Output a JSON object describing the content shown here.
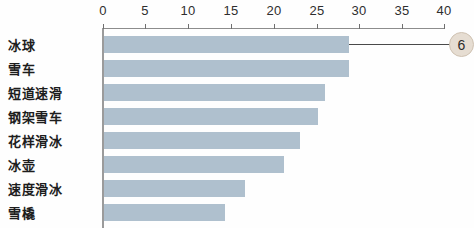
{
  "chart_data": {
    "type": "bar",
    "orientation": "horizontal",
    "title": "",
    "xlabel": "",
    "ylabel": "",
    "categories": [
      "冰球",
      "雪车",
      "短道速滑",
      "钢架雪车",
      "花样滑冰",
      "冰壶",
      "速度滑冰",
      "雪橇"
    ],
    "values": [
      29,
      29,
      26,
      25,
      23,
      21,
      17,
      14
    ],
    "xlim": [
      0,
      42
    ],
    "xticks": [
      0,
      5,
      10,
      15,
      20,
      25,
      30,
      35,
      40
    ],
    "xtick_labels": [
      "0",
      "5",
      "10",
      "15",
      "20",
      "25",
      "30",
      "35",
      "40"
    ],
    "grid": false,
    "legend": null,
    "bar_color": "#afc0ce",
    "axis_color": "#8c8c8c",
    "annotations": [
      {
        "label": "6",
        "attached_to_category": "冰球",
        "bubble_color": "#e6ddd2",
        "leader_line_color": "#4a4a4a"
      }
    ]
  },
  "axis": {
    "ticks": [
      {
        "value": "0",
        "x": 103
      },
      {
        "value": "5",
        "x": 145
      },
      {
        "value": "10",
        "x": 188
      },
      {
        "value": "15",
        "x": 231
      },
      {
        "value": "20",
        "x": 274
      },
      {
        "value": "25",
        "x": 317
      },
      {
        "value": "30",
        "x": 359
      },
      {
        "value": "35",
        "x": 402
      },
      {
        "value": "40",
        "x": 444
      }
    ]
  },
  "rows": [
    {
      "label": "冰球",
      "value": 29,
      "bar_px": 245,
      "top": 36,
      "height": 17,
      "label_y": 44
    },
    {
      "label": "雪车",
      "value": 29,
      "bar_px": 245,
      "top": 60,
      "height": 17,
      "label_y": 68
    },
    {
      "label": "短道速滑",
      "value": 26,
      "bar_px": 221,
      "top": 84,
      "height": 17,
      "label_y": 92
    },
    {
      "label": "钢架雪车",
      "value": 25,
      "bar_px": 214,
      "top": 108,
      "height": 17,
      "label_y": 116
    },
    {
      "label": "花样滑冰",
      "value": 23,
      "bar_px": 196,
      "top": 132,
      "height": 17,
      "label_y": 140
    },
    {
      "label": "冰壶",
      "value": 21,
      "bar_px": 180,
      "top": 156,
      "height": 17,
      "label_y": 164
    },
    {
      "label": "速度滑冰",
      "value": 17,
      "bar_px": 141,
      "top": 180,
      "height": 17,
      "label_y": 188
    },
    {
      "label": "雪橇",
      "value": 14,
      "bar_px": 121,
      "top": 204,
      "height": 17,
      "label_y": 212
    }
  ],
  "callout": {
    "label": "6",
    "line_left": 349,
    "line_top": 44,
    "line_width": 104,
    "bubble_left": 449,
    "bubble_top": 32,
    "bubble_size": 25
  }
}
